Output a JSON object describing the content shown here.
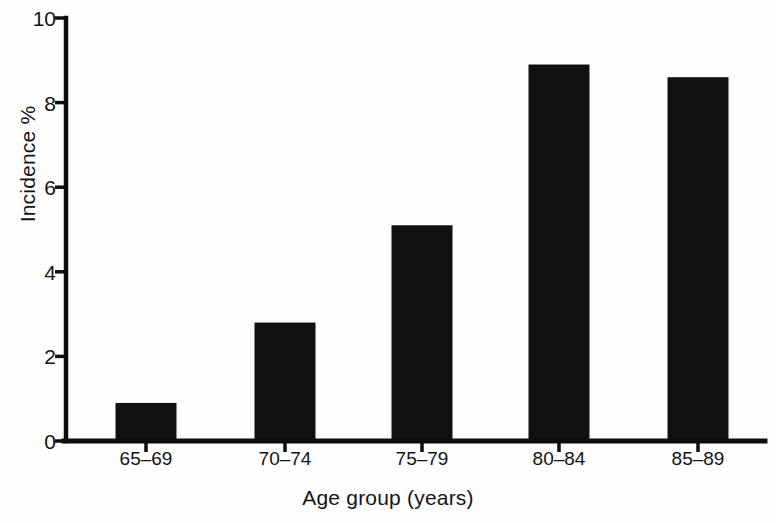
{
  "chart_data": {
    "type": "bar",
    "title": "",
    "subtitle": "",
    "xlabel": "Age group (years)",
    "ylabel": "Incidence %",
    "categories": [
      "65–69",
      "70–74",
      "75–79",
      "80–84",
      "85–89"
    ],
    "values": [
      0.9,
      2.8,
      5.1,
      8.9,
      8.6
    ],
    "series": [
      {
        "name": "Incidence %",
        "values": [
          0.9,
          2.8,
          5.1,
          8.9,
          8.6
        ]
      }
    ],
    "ylim": [
      0,
      10
    ],
    "xlim": [
      0,
      5
    ],
    "y_ticks": [
      0,
      2,
      4,
      6,
      8,
      10
    ],
    "y_ticklabels": [
      "0",
      "2",
      "4",
      "6",
      "8",
      "10"
    ],
    "grid": false,
    "legend": false,
    "legend_position": "none",
    "annotations": [],
    "bar_color": "#111111",
    "axis_color": "#0d0d0d",
    "background_color": "#fefefe"
  },
  "layout": {
    "plot_left": 66,
    "plot_right": 765,
    "plot_top": 18,
    "plot_bottom": 441,
    "bar_width": 61,
    "bar_centers": [
      146,
      285,
      422,
      559,
      698
    ]
  }
}
